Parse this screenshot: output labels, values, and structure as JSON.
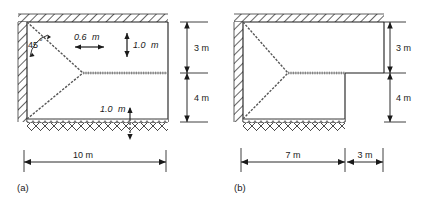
{
  "figure": {
    "type": "engineering-diagram",
    "panels": [
      {
        "id": "a",
        "caption": "(a)",
        "annotations": {
          "angle": "45",
          "angle_symbol": "°",
          "width_small": "0.6",
          "width_small_unit": "m",
          "height_small_top": "1.0",
          "height_small_top_unit": "m",
          "height_small_bottom": "1.0",
          "height_small_bottom_unit": "m",
          "dim_right_top": "3 m",
          "dim_right_bottom": "4 m",
          "dim_bottom": "10 m"
        }
      },
      {
        "id": "b",
        "caption": "(b)",
        "annotations": {
          "dim_right_top": "3 m",
          "dim_right_bottom": "4 m",
          "dim_bottom_left": "7 m",
          "dim_bottom_right": "3 m"
        }
      }
    ],
    "colors": {
      "line": "#1a1a1a",
      "hatch": "#3a3a3a",
      "background": "#ffffff",
      "dim_line": "#2b2b2b",
      "interface": "#8a8a8a"
    }
  }
}
